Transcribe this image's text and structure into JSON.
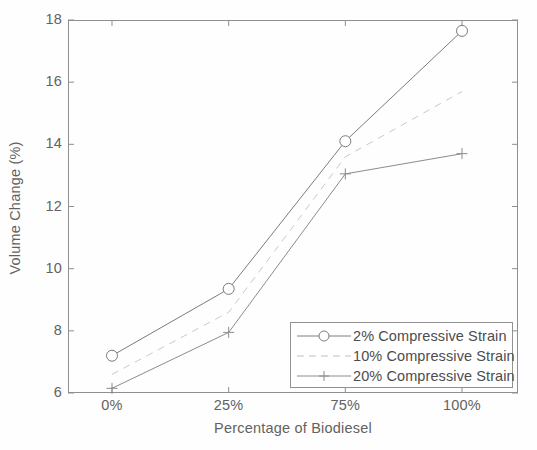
{
  "chart_data": {
    "type": "line",
    "title": "",
    "xlabel": "Percentage of Biodiesel",
    "ylabel": "Volume Change (%)",
    "categories": [
      "0%",
      "25%",
      "75%",
      "100%"
    ],
    "xtick_labels": [
      "0%",
      "25%",
      "75%",
      "100%"
    ],
    "ytick_labels": [
      "6",
      "8",
      "10",
      "12",
      "14",
      "16",
      "18"
    ],
    "ytick_values": [
      6,
      8,
      10,
      12,
      14,
      16,
      18
    ],
    "ylim": [
      6,
      18
    ],
    "xlim": [
      0,
      3
    ],
    "grid": false,
    "legend_position": "lower right",
    "series": [
      {
        "name": "2% Compressive Strain",
        "values": [
          7.2,
          9.35,
          14.1,
          17.65
        ],
        "marker": "circle",
        "linestyle": "solid",
        "color": "#7a7a7a"
      },
      {
        "name": "10% Compressive Strain",
        "values": [
          6.6,
          8.6,
          13.6,
          15.7
        ],
        "marker": "none",
        "linestyle": "dashed",
        "color": "#c9c9c9"
      },
      {
        "name": "20% Compressive Strain",
        "values": [
          6.15,
          7.95,
          13.05,
          13.7
        ],
        "marker": "plus",
        "linestyle": "solid",
        "color": "#8a8a8a"
      }
    ]
  },
  "legend": {
    "items": [
      {
        "label": "2% Compressive Strain"
      },
      {
        "label": "10% Compressive Strain"
      },
      {
        "label": "20% Compressive Strain"
      }
    ]
  },
  "axes": {
    "y_title": "Volume Change (%)",
    "x_title": "Percentage of Biodiesel",
    "y_ticks": [
      "6",
      "8",
      "10",
      "12",
      "14",
      "16",
      "18"
    ],
    "x_ticks": [
      "0%",
      "25%",
      "75%",
      "100%"
    ]
  },
  "colors": {
    "axis": "#8d8d8d",
    "text": "#5f5f5f",
    "series_1": "#7a7a7a",
    "series_2": "#c9c9c9",
    "series_3": "#8a8a8a",
    "background": "#ffffff"
  }
}
